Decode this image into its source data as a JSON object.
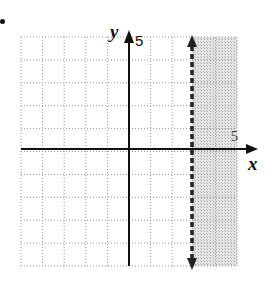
{
  "chart_data": {
    "type": "inequality-graph",
    "title": "",
    "inequality": "x > 3",
    "boundary": {
      "line": "x = 3",
      "style": "dashed",
      "color": "#222222"
    },
    "shaded_region": "x > 3",
    "xlabel": "x",
    "ylabel": "y",
    "xlim": [
      -5,
      5
    ],
    "ylim": [
      -5,
      5
    ],
    "x_tick_labels": [
      {
        "value": 5,
        "label": "5"
      }
    ],
    "y_tick_labels": [
      {
        "value": 5,
        "label": "5"
      }
    ],
    "grid": {
      "on": true,
      "style": "dotted",
      "step": 1
    }
  },
  "labels": {
    "x_axis": "x",
    "y_axis": "y",
    "x_tick_5": "5",
    "y_tick_5": "5"
  },
  "colors": {
    "axis": "#111111",
    "grid": "#9a9a9a",
    "shade": "#d4d4d4",
    "boundary": "#222222"
  }
}
